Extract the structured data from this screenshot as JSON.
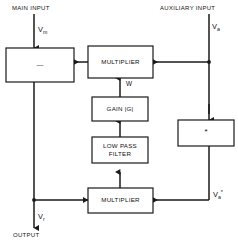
{
  "diagram": {
    "line_color": "#1a1a1a",
    "box_fill": "#ffffff",
    "background": "#ffffff",
    "headers": {
      "main_input": "MAIN INPUT",
      "auxiliary_input": "AUXILIARY INPUT"
    },
    "blocks": {
      "summer": "",
      "upper_multiplier": "MULTIPLIER",
      "gain": "GAIN |G|",
      "low_pass_filter": "LOW PASS\nFILTER",
      "lower_multiplier": "MULTIPLIER",
      "conjugate": "*"
    },
    "signals": {
      "main_in": "V",
      "main_in_sub": "m",
      "aux_in": "V",
      "aux_in_sub": "a",
      "aux_conj": "V",
      "aux_conj_sub": "a",
      "aux_conj_sup": "*",
      "weight": "W",
      "output_sig": "V",
      "output_sig_sub": "r",
      "output_label": "OUTPUT"
    },
    "summer_symbol": "—"
  }
}
